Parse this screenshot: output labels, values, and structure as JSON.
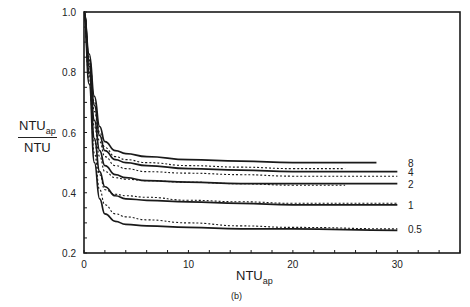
{
  "chart_data": {
    "type": "line",
    "title": "",
    "caption": "(b)",
    "xlabel": "NTU_ap",
    "xlabel_main": "NTU",
    "xlabel_sub": "ap",
    "ylabel": "NTU_ap / NTU",
    "ylabel_num_main": "NTU",
    "ylabel_num_sub": "ap",
    "ylabel_den": "NTU",
    "xlim": [
      0,
      36
    ],
    "ylim": [
      0.2,
      1.0
    ],
    "xticks": [
      0,
      10,
      20,
      30
    ],
    "yticks": [
      0.2,
      0.4,
      0.6,
      0.8,
      1.0
    ],
    "ytick_labels": [
      "0.2",
      "0.4",
      "0.6",
      "0.8",
      "1.0"
    ],
    "xtick_labels": [
      "0",
      "10",
      "20",
      "30"
    ],
    "grid": false,
    "legend": "inline labels at right end of curves",
    "series": [
      {
        "name": "8",
        "style": "solid",
        "x": [
          0,
          0.5,
          1,
          1.5,
          2,
          3,
          4,
          6,
          10,
          15,
          20,
          28
        ],
        "values": [
          1.0,
          0.86,
          0.72,
          0.62,
          0.57,
          0.54,
          0.53,
          0.52,
          0.51,
          0.505,
          0.5,
          0.5
        ]
      },
      {
        "name": "8",
        "style": "dashed",
        "x": [
          0,
          0.5,
          1,
          1.5,
          2,
          3,
          4,
          6,
          10,
          15,
          20,
          25
        ],
        "values": [
          1.0,
          0.85,
          0.7,
          0.6,
          0.55,
          0.52,
          0.51,
          0.5,
          0.49,
          0.485,
          0.48,
          0.48
        ]
      },
      {
        "name": "4",
        "style": "solid",
        "x": [
          0,
          0.5,
          1,
          1.5,
          2,
          3,
          4,
          6,
          10,
          15,
          20,
          30
        ],
        "values": [
          1.0,
          0.84,
          0.69,
          0.59,
          0.54,
          0.51,
          0.5,
          0.49,
          0.48,
          0.475,
          0.47,
          0.47
        ]
      },
      {
        "name": "4",
        "style": "dashed",
        "x": [
          0,
          0.5,
          1,
          1.5,
          2,
          3,
          4,
          6,
          10,
          15,
          20,
          30
        ],
        "values": [
          1.0,
          0.83,
          0.67,
          0.57,
          0.52,
          0.49,
          0.48,
          0.47,
          0.465,
          0.46,
          0.455,
          0.455
        ]
      },
      {
        "name": "2",
        "style": "solid",
        "x": [
          0,
          0.5,
          1,
          1.5,
          2,
          3,
          4,
          6,
          10,
          15,
          20,
          30
        ],
        "values": [
          1.0,
          0.82,
          0.64,
          0.54,
          0.49,
          0.46,
          0.45,
          0.44,
          0.435,
          0.43,
          0.43,
          0.43
        ]
      },
      {
        "name": "2",
        "style": "dashed",
        "x": [
          0,
          0.5,
          1,
          1.5,
          2,
          3,
          4,
          6,
          10,
          15,
          20,
          25
        ],
        "values": [
          1.0,
          0.81,
          0.62,
          0.52,
          0.47,
          0.45,
          0.445,
          0.44,
          0.435,
          0.43,
          0.425,
          0.425
        ]
      },
      {
        "name": "1",
        "style": "solid",
        "x": [
          0,
          0.5,
          1,
          1.5,
          2,
          3,
          4,
          6,
          10,
          15,
          20,
          30
        ],
        "values": [
          1.0,
          0.8,
          0.58,
          0.47,
          0.42,
          0.39,
          0.38,
          0.375,
          0.37,
          0.365,
          0.36,
          0.36
        ]
      },
      {
        "name": "1",
        "style": "dashed",
        "x": [
          0,
          0.5,
          1,
          1.5,
          2,
          3,
          4,
          6,
          10,
          15,
          20,
          30
        ],
        "values": [
          1.0,
          0.79,
          0.57,
          0.46,
          0.41,
          0.395,
          0.39,
          0.385,
          0.375,
          0.37,
          0.365,
          0.365
        ]
      },
      {
        "name": "0.5",
        "style": "solid",
        "x": [
          0,
          0.5,
          1,
          1.5,
          2,
          3,
          4,
          6,
          10,
          15,
          20,
          30
        ],
        "values": [
          1.0,
          0.76,
          0.5,
          0.38,
          0.33,
          0.305,
          0.295,
          0.29,
          0.285,
          0.28,
          0.28,
          0.275
        ]
      },
      {
        "name": "0.5",
        "style": "dashed",
        "x": [
          0,
          0.5,
          1,
          1.5,
          2,
          3,
          4,
          6,
          10,
          15,
          20,
          30
        ],
        "values": [
          1.0,
          0.77,
          0.53,
          0.41,
          0.36,
          0.33,
          0.32,
          0.31,
          0.3,
          0.29,
          0.285,
          0.28
        ]
      }
    ],
    "curve_labels": [
      {
        "text": "8",
        "y": 0.5
      },
      {
        "text": "4",
        "y": 0.47
      },
      {
        "text": "2",
        "y": 0.43
      },
      {
        "text": "1",
        "y": 0.36
      },
      {
        "text": "0.5",
        "y": 0.28
      }
    ]
  },
  "colors": {
    "line": "#1a1a1a",
    "axis": "#1a1a1a",
    "background": "#ffffff"
  }
}
